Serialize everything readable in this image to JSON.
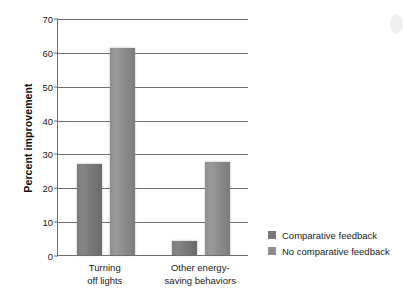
{
  "chart_data": {
    "type": "bar",
    "title": "",
    "xlabel": "",
    "ylabel": "Percent improvement",
    "ylim": [
      0,
      70
    ],
    "yticks": [
      0,
      10,
      20,
      30,
      40,
      50,
      60,
      70
    ],
    "grid": true,
    "legend_position": "right",
    "categories": [
      "Turning off lights",
      "Other energy-saving behaviors"
    ],
    "category_lines": [
      [
        "Turning",
        "off lights"
      ],
      [
        "Other energy-",
        "saving behaviors"
      ]
    ],
    "series": [
      {
        "name": "Comparative feedback",
        "color": "#7a7a7a",
        "values": [
          27,
          4
        ]
      },
      {
        "name": "No comparative feedback",
        "color": "#8d8d8d",
        "values": [
          61,
          27.5
        ]
      }
    ]
  },
  "legend": {
    "items": [
      {
        "label": "Comparative feedback",
        "color": "#7a7a7a"
      },
      {
        "label": "No comparative feedback",
        "color": "#8d8d8d"
      }
    ]
  }
}
